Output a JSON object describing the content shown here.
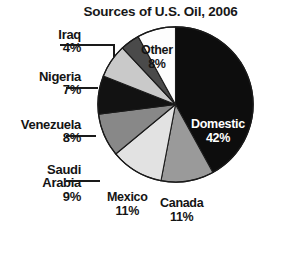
{
  "chart_data": {
    "type": "pie",
    "title": "Sources of U.S. Oil, 2006",
    "xlabel": "",
    "ylabel": "",
    "legend": "none",
    "grid": false,
    "units": "percent",
    "start_angle_deg": 0,
    "direction": "clockwise",
    "categories": [
      "Domestic",
      "Canada",
      "Mexico",
      "Saudi Arabia",
      "Venezuela",
      "Nigeria",
      "Iraq",
      "Other"
    ],
    "values": [
      42,
      11,
      11,
      9,
      8,
      7,
      4,
      8
    ],
    "slices": [
      {
        "label": "Domestic",
        "value": 42,
        "percent_text": "42%",
        "color": "#0d0d0d",
        "label_placement": "inside",
        "text_color": "#ffffff"
      },
      {
        "label": "Canada",
        "value": 11,
        "percent_text": "11%",
        "color": "#9a9a9a",
        "label_placement": "inside",
        "text_color": "#141414"
      },
      {
        "label": "Mexico",
        "value": 11,
        "percent_text": "11%",
        "color": "#e2e2e2",
        "label_placement": "inside",
        "text_color": "#141414"
      },
      {
        "label": "Saudi Arabia",
        "value": 9,
        "percent_text": "9%",
        "color": "#888888",
        "label_placement": "outside",
        "text_color": "#141414"
      },
      {
        "label": "Venezuela",
        "value": 8,
        "percent_text": "8%",
        "color": "#121212",
        "label_placement": "outside",
        "text_color": "#141414"
      },
      {
        "label": "Nigeria",
        "value": 7,
        "percent_text": "7%",
        "color": "#c9c9c9",
        "label_placement": "outside",
        "text_color": "#141414"
      },
      {
        "label": "Iraq",
        "value": 4,
        "percent_text": "4%",
        "color": "#4a4a4a",
        "label_placement": "outside",
        "text_color": "#141414"
      },
      {
        "label": "Other",
        "value": 8,
        "percent_text": "8%",
        "color": "#fdfdfd",
        "label_placement": "inside",
        "text_color": "#141414"
      }
    ]
  },
  "chart": {
    "title": "Sources of U.S. Oil, 2006",
    "labels": {
      "iraq": {
        "name": "Iraq",
        "percent": "4%"
      },
      "nigeria": {
        "name": "Nigeria",
        "percent": "7%"
      },
      "venezuela": {
        "name": "Venezuela",
        "percent": "8%"
      },
      "saudi": {
        "name": "Saudi",
        "name2": "Arabia",
        "percent": "9%"
      },
      "domestic": {
        "name": "Domestic",
        "percent": "42%"
      },
      "other": {
        "name": "Other",
        "percent": "8%"
      },
      "canada": {
        "name": "Canada",
        "percent": "11%"
      },
      "mexico": {
        "name": "Mexico",
        "percent": "11%"
      }
    }
  },
  "colors": {
    "background": "#ffffff",
    "text": "#141414",
    "outline": "#1a1a1a",
    "domestic": "#0d0d0d",
    "canada": "#9a9a9a",
    "mexico": "#e2e2e2",
    "saudi": "#888888",
    "venezuela": "#121212",
    "nigeria": "#c9c9c9",
    "iraq": "#4a4a4a",
    "other": "#fdfdfd"
  }
}
